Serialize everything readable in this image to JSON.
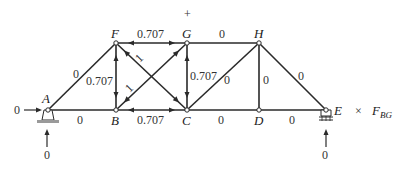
{
  "diagram": {
    "type": "truss",
    "plus_marker": "+",
    "nodes": [
      {
        "id": "A",
        "label": "A",
        "x": 48,
        "y": 110
      },
      {
        "id": "B",
        "label": "B",
        "x": 116,
        "y": 110
      },
      {
        "id": "C",
        "label": "C",
        "x": 187,
        "y": 110
      },
      {
        "id": "D",
        "label": "D",
        "x": 259,
        "y": 110
      },
      {
        "id": "E",
        "label": "E",
        "x": 326,
        "y": 110
      },
      {
        "id": "F",
        "label": "F",
        "x": 116,
        "y": 43
      },
      {
        "id": "G",
        "label": "G",
        "x": 187,
        "y": 43
      },
      {
        "id": "H",
        "label": "H",
        "x": 259,
        "y": 43
      }
    ],
    "members": [
      {
        "id": "AB",
        "force": "0"
      },
      {
        "id": "BC",
        "force": "0.707"
      },
      {
        "id": "CD",
        "force": "0"
      },
      {
        "id": "DE",
        "force": "0"
      },
      {
        "id": "FG",
        "force": "0.707"
      },
      {
        "id": "GH",
        "force": "0"
      },
      {
        "id": "AF",
        "force": "0"
      },
      {
        "id": "BF",
        "force": "0.707"
      },
      {
        "id": "CG",
        "force": "0.707"
      },
      {
        "id": "DH",
        "force": "0"
      },
      {
        "id": "FC",
        "force": "1"
      },
      {
        "id": "BG",
        "force": "1"
      },
      {
        "id": "CH",
        "force": "0"
      },
      {
        "id": "HE",
        "force": "0"
      }
    ],
    "reactions": {
      "A_horizontal": "0",
      "A_vertical": "0",
      "E_vertical": "0"
    },
    "caption": {
      "multiplier": "×",
      "symbol": "F",
      "subscript": "BG"
    }
  }
}
